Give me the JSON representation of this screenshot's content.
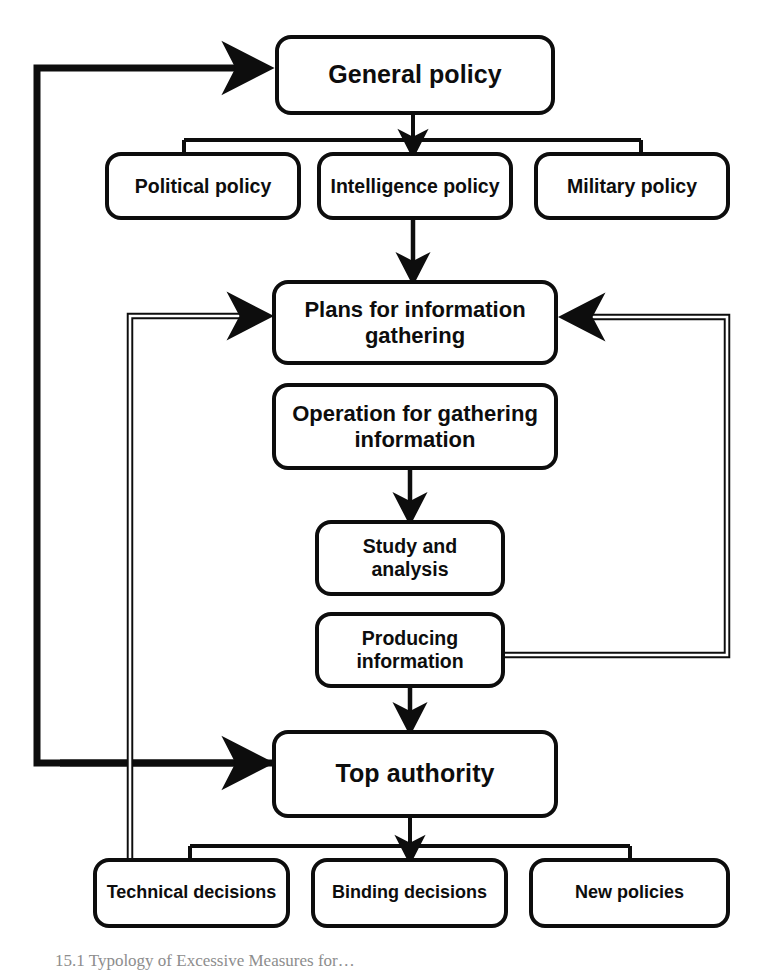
{
  "diagram": {
    "stroke_color": "#0d0d0d",
    "background_color": "#ffffff",
    "nodes": {
      "general_policy": "General policy",
      "political_policy": "Political policy",
      "intelligence_policy": "Intelligence policy",
      "military_policy": "Military policy",
      "plans_for_information_gathering": "Plans for information\ngathering",
      "operation_for_gathering_information": "Operation for gathering\ninformation",
      "study_and_analysis": "Study and\nanalysis",
      "producing_information": "Producing\ninformation",
      "top_authority": "Top authority",
      "technical_decisions": "Technical decisions",
      "binding_decisions": "Binding decisions",
      "new_policies": "New policies"
    },
    "caption": "15.1 Typology of Excessive Measures for…"
  }
}
